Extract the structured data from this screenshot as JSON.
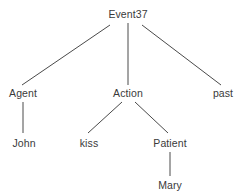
{
  "diagram": {
    "type": "tree",
    "title_text": "",
    "background_color": "#ffffff",
    "text_color": "#3a3a3a",
    "edge_color": "#4a4a4a",
    "edge_width": 1,
    "nodes": [
      {
        "id": "root",
        "label": "Event37",
        "x": 128,
        "y": 14,
        "level": 0
      },
      {
        "id": "agent",
        "label": "Agent",
        "x": 23,
        "y": 93,
        "level": 1
      },
      {
        "id": "action",
        "label": "Action",
        "x": 128,
        "y": 93,
        "level": 1
      },
      {
        "id": "past",
        "label": "past",
        "x": 223,
        "y": 93,
        "level": 1
      },
      {
        "id": "john",
        "label": "John",
        "x": 24,
        "y": 143,
        "level": 2
      },
      {
        "id": "kiss",
        "label": "kiss",
        "x": 89,
        "y": 143,
        "level": 2
      },
      {
        "id": "patient",
        "label": "Patient",
        "x": 170,
        "y": 143,
        "level": 2
      },
      {
        "id": "mary",
        "label": "Mary",
        "x": 170,
        "y": 185,
        "level": 3
      }
    ],
    "edges": [
      {
        "id": "root-agent",
        "from": "root",
        "to": "agent",
        "x1": 110,
        "y1": 25,
        "x2": 22,
        "y2": 85
      },
      {
        "id": "root-action",
        "from": "root",
        "to": "action",
        "x1": 128,
        "y1": 23,
        "x2": 128,
        "y2": 85
      },
      {
        "id": "root-past",
        "from": "root",
        "to": "past",
        "x1": 142,
        "y1": 25,
        "x2": 221,
        "y2": 85
      },
      {
        "id": "agent-john",
        "from": "agent",
        "to": "john",
        "x1": 23,
        "y1": 102,
        "x2": 23,
        "y2": 133
      },
      {
        "id": "action-kiss",
        "from": "action",
        "to": "kiss",
        "x1": 122,
        "y1": 102,
        "x2": 88,
        "y2": 133
      },
      {
        "id": "action-patient",
        "from": "action",
        "to": "patient",
        "x1": 135,
        "y1": 102,
        "x2": 168,
        "y2": 133
      },
      {
        "id": "patient-mary",
        "from": "patient",
        "to": "mary",
        "x1": 170,
        "y1": 152,
        "x2": 170,
        "y2": 176
      }
    ]
  }
}
